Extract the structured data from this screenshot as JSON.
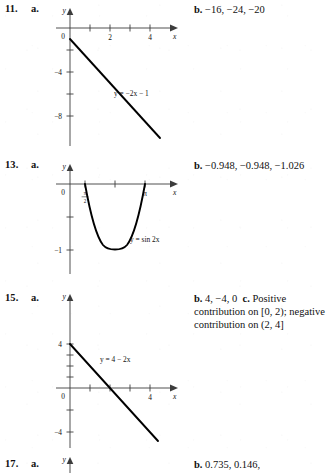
{
  "page": {
    "background": "#ffffff",
    "ink": "#111111",
    "axis_color": "#3c3c3c",
    "curve_color": "#000000"
  },
  "problems": [
    {
      "number": "11.",
      "part_a_label": "a.",
      "answer_b_marker": "b.",
      "answer_b_text": "−16, −24, −20",
      "graph": {
        "equation_label": "y = −2x − 1",
        "x_axis_name": "x",
        "y_axis_name": "y",
        "origin_label": "0",
        "x_ticks": [
          {
            "value": 1,
            "label": ""
          },
          {
            "value": 2,
            "label": "2"
          },
          {
            "value": 3,
            "label": ""
          },
          {
            "value": 4,
            "label": "4"
          }
        ],
        "y_ticks": [
          {
            "value": -2,
            "label": ""
          },
          {
            "value": -4,
            "label": "−4"
          },
          {
            "value": -6,
            "label": ""
          },
          {
            "value": -8,
            "label": "−8"
          }
        ],
        "xlim": [
          -0.7,
          5.2
        ],
        "ylim": [
          -10.5,
          1.6
        ],
        "line": {
          "slope": -2,
          "intercept": -1,
          "x_from": 0,
          "x_to": 4.5
        }
      }
    },
    {
      "number": "13.",
      "part_a_label": "a.",
      "answer_b_marker": "b.",
      "answer_b_text": "−0.948, −0.948, −1.026",
      "graph": {
        "equation_label": "y = sin 2x",
        "x_axis_name": "x",
        "y_axis_name": "y",
        "origin_label": "0",
        "x_ticks": [
          {
            "value": 1.5707963,
            "label": "π/2",
            "fraction": {
              "num": "π",
              "den": "2"
            }
          },
          {
            "value": 2.3561945,
            "label": ""
          },
          {
            "value": 3.1415927,
            "label": "π"
          }
        ],
        "y_ticks": [
          {
            "value": -0.5,
            "label": ""
          },
          {
            "value": -1,
            "label": "−1"
          }
        ],
        "xlim": [
          -0.55,
          4.1
        ],
        "ylim": [
          -1.55,
          0.35
        ],
        "curve": {
          "function": "sin(2x)",
          "x_from": 1.5707963,
          "x_to": 3.1415927
        }
      }
    },
    {
      "number": "15.",
      "part_a_label": "a.",
      "answer_b_marker": "b.",
      "answer_b_text": "4, −4, 0",
      "answer_c_marker": "c.",
      "answer_c_text": "Positive contribution on [0, 2); negative contribution on (2, 4]",
      "graph": {
        "equation_label": "y = 4 − 2x",
        "x_axis_name": "x",
        "y_axis_name": "y",
        "origin_label": "0",
        "x_ticks": [
          {
            "value": 1,
            "label": ""
          },
          {
            "value": 2,
            "label": ""
          },
          {
            "value": 3,
            "label": ""
          },
          {
            "value": 4,
            "label": "4"
          }
        ],
        "y_ticks": [
          {
            "value": 4,
            "label": "4"
          },
          {
            "value": 3,
            "label": ""
          },
          {
            "value": 2,
            "label": ""
          },
          {
            "value": 1,
            "label": ""
          },
          {
            "value": -2,
            "label": ""
          },
          {
            "value": -4,
            "label": "−4"
          },
          {
            "value": -6,
            "label": ""
          }
        ],
        "xlim": [
          -0.7,
          5.3
        ],
        "ylim": [
          -7.2,
          5.6
        ],
        "line": {
          "slope": -2,
          "intercept": 4,
          "x_from": 0,
          "x_to": 4.4
        }
      }
    },
    {
      "number": "17.",
      "part_a_label": "a.",
      "answer_b_marker": "b.",
      "answer_b_text": "0.735, 0.146,",
      "graph": {
        "y_axis_name": "y"
      }
    }
  ]
}
